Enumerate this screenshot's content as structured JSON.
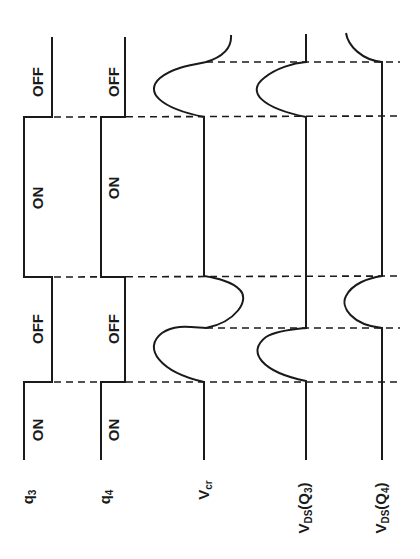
{
  "diagram": {
    "type": "timing-diagram",
    "orientation": "rotated-90-ccw (time runs bottom to top)",
    "colors": {
      "line": "#1a1a1a",
      "background": "#ffffff"
    },
    "signals": [
      {
        "id": "q3",
        "label": "q",
        "subscript": "3",
        "states": [
          "ON",
          "OFF",
          "ON",
          "OFF"
        ]
      },
      {
        "id": "q4",
        "label": "q",
        "subscript": "4",
        "states": [
          "ON",
          "OFF",
          "ON",
          "OFF"
        ]
      },
      {
        "id": "vcr",
        "label": "V",
        "subscript": "cr"
      },
      {
        "id": "vds_q3",
        "label": "V",
        "subscript": "DS",
        "suffix": "(Q",
        "suffix_sub": "3",
        "suffix_end": ")"
      },
      {
        "id": "vds_q4",
        "label": "V",
        "subscript": "DS",
        "suffix": "(Q",
        "suffix_sub": "4",
        "suffix_end": ")"
      }
    ],
    "state_labels": {
      "q3": [
        "ON",
        "OFF",
        "ON",
        "OFF"
      ],
      "q4": [
        "ON",
        "OFF",
        "ON",
        "OFF"
      ]
    }
  }
}
